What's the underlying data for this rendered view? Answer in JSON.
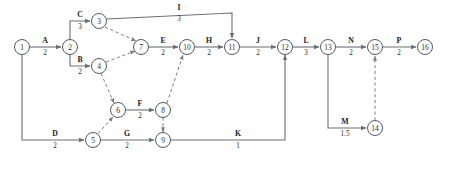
{
  "diagram": {
    "kind": "activity-on-arrow-network",
    "colors": {
      "background": "#ffffff",
      "node_stroke": "#555a5e",
      "edge_stroke": "#6a6f73",
      "dashed_stroke": "#7a7f83",
      "text": "#1d1d1d"
    },
    "nodes": [
      {
        "id": "1",
        "label": "1",
        "x": 22,
        "y": 47,
        "r": 7.5
      },
      {
        "id": "2",
        "label": "2",
        "x": 70,
        "y": 47,
        "r": 7.5
      },
      {
        "id": "3",
        "label": "3",
        "x": 99,
        "y": 21,
        "r": 7.5
      },
      {
        "id": "4",
        "label": "4",
        "x": 99,
        "y": 66,
        "r": 7.5
      },
      {
        "id": "5",
        "label": "5",
        "x": 93,
        "y": 140,
        "r": 7.5
      },
      {
        "id": "6",
        "label": "6",
        "x": 118,
        "y": 110,
        "r": 7.5
      },
      {
        "id": "7",
        "label": "7",
        "x": 141,
        "y": 47,
        "r": 7.5
      },
      {
        "id": "8",
        "label": "8",
        "x": 163,
        "y": 110,
        "r": 7.5
      },
      {
        "id": "9",
        "label": "9",
        "x": 163,
        "y": 140,
        "r": 7.5
      },
      {
        "id": "10",
        "label": "10",
        "x": 187,
        "y": 47,
        "r": 7.5
      },
      {
        "id": "11",
        "label": "11",
        "x": 232,
        "y": 47,
        "r": 7.5
      },
      {
        "id": "12",
        "label": "12",
        "x": 285,
        "y": 47,
        "r": 7.5
      },
      {
        "id": "13",
        "label": "13",
        "x": 328,
        "y": 47,
        "r": 7.5
      },
      {
        "id": "14",
        "label": "14",
        "x": 375,
        "y": 128,
        "r": 7.5
      },
      {
        "id": "15",
        "label": "15",
        "x": 375,
        "y": 47,
        "r": 7.5
      },
      {
        "id": "16",
        "label": "16",
        "x": 425,
        "y": 47,
        "r": 7.5
      }
    ],
    "activities": [
      {
        "name": "A",
        "duration": "2",
        "from": "1",
        "to": "2",
        "style": "solid",
        "path": "M 29.5 47 L 61 47",
        "label_x": 45,
        "label_name_y": 43,
        "label_dur_y": 50
      },
      {
        "name": "C",
        "duration": "3",
        "from": "2",
        "to": "3",
        "style": "solid",
        "path": "M 70 39.5 L 70 21 L 90 21",
        "label_x": 80,
        "label_name_y": 17,
        "label_dur_y": 24
      },
      {
        "name": "B",
        "duration": "2",
        "from": "2",
        "to": "4",
        "style": "solid",
        "path": "M 70 54.5 L 70 66 L 90 66",
        "label_x": 80,
        "label_name_y": 62,
        "label_dur_y": 69
      },
      {
        "name": "I",
        "duration": "3",
        "from": "3",
        "to": "11",
        "style": "solid",
        "path": "M 106.5 19 L 232 13 L 232 38",
        "label_x": 179,
        "label_name_y": 10,
        "label_dur_y": 16
      },
      {
        "name": "E",
        "duration": "2",
        "from": "7",
        "to": "10",
        "style": "solid",
        "path": "M 148.5 47 L 178 47",
        "label_x": 163,
        "label_name_y": 43,
        "label_dur_y": 50
      },
      {
        "name": "H",
        "duration": "2",
        "from": "10",
        "to": "11",
        "style": "solid",
        "path": "M 194.5 47 L 223 47",
        "label_x": 209,
        "label_name_y": 43,
        "label_dur_y": 50
      },
      {
        "name": "J",
        "duration": "2",
        "from": "11",
        "to": "12",
        "style": "solid",
        "path": "M 239.5 47 L 276 47",
        "label_x": 258,
        "label_name_y": 43,
        "label_dur_y": 50
      },
      {
        "name": "L",
        "duration": "3",
        "from": "12",
        "to": "13",
        "style": "solid",
        "path": "M 292.5 47 L 319 47",
        "label_x": 306,
        "label_name_y": 43,
        "label_dur_y": 50
      },
      {
        "name": "N",
        "duration": "2",
        "from": "13",
        "to": "15",
        "style": "solid",
        "path": "M 335.5 47 L 366 47",
        "label_x": 351,
        "label_name_y": 43,
        "label_dur_y": 50
      },
      {
        "name": "P",
        "duration": "2",
        "from": "15",
        "to": "16",
        "style": "solid",
        "path": "M 382.5 47 L 416 47",
        "label_x": 399,
        "label_name_y": 43,
        "label_dur_y": 50
      },
      {
        "name": "D",
        "duration": "2",
        "from": "1",
        "to": "5",
        "style": "solid",
        "path": "M 22 54.5 L 22 140 L 84 140",
        "label_x": 55,
        "label_name_y": 136,
        "label_dur_y": 143
      },
      {
        "name": "G",
        "duration": "2",
        "from": "5",
        "to": "9",
        "style": "solid",
        "path": "M 100.5 140 L 154 140",
        "label_x": 127,
        "label_name_y": 136,
        "label_dur_y": 143
      },
      {
        "name": "F",
        "duration": "2",
        "from": "6",
        "to": "8",
        "style": "solid",
        "path": "M 125.5 110 L 154 110",
        "label_x": 140,
        "label_name_y": 106,
        "label_dur_y": 113
      },
      {
        "name": "K",
        "duration": "1",
        "from": "9",
        "to": "12",
        "style": "solid",
        "path": "M 170.5 140 L 285 140 L 285 55",
        "label_x": 238,
        "label_name_y": 136,
        "label_dur_y": 143
      },
      {
        "name": "M",
        "duration": "1.5",
        "from": "13",
        "to": "14",
        "style": "solid",
        "path": "M 328 54.5 L 328 128 L 366 128",
        "label_x": 345,
        "label_name_y": 124,
        "label_dur_y": 131
      },
      {
        "name": "",
        "duration": "",
        "from": "3",
        "to": "7",
        "style": "dashed",
        "path": "M 105 27 L 136 41",
        "label_x": 0,
        "label_name_y": 0,
        "label_dur_y": 0
      },
      {
        "name": "",
        "duration": "",
        "from": "4",
        "to": "7",
        "style": "dashed",
        "path": "M 106 62 L 135 51",
        "label_x": 0,
        "label_name_y": 0,
        "label_dur_y": 0
      },
      {
        "name": "",
        "duration": "",
        "from": "4",
        "to": "6",
        "style": "dashed",
        "path": "M 101 73.5 L 114 103",
        "label_x": 0,
        "label_name_y": 0,
        "label_dur_y": 0
      },
      {
        "name": "",
        "duration": "",
        "from": "5",
        "to": "6",
        "style": "dashed",
        "path": "M 98 133.5 L 113 117",
        "label_x": 0,
        "label_name_y": 0,
        "label_dur_y": 0
      },
      {
        "name": "",
        "duration": "",
        "from": "8",
        "to": "9",
        "style": "dashed",
        "path": "M 163 117.5 L 163 132",
        "label_x": 0,
        "label_name_y": 0,
        "label_dur_y": 0
      },
      {
        "name": "",
        "duration": "",
        "from": "8",
        "to": "10",
        "style": "dashed",
        "path": "M 167 103 L 183 55",
        "label_x": 0,
        "label_name_y": 0,
        "label_dur_y": 0
      },
      {
        "name": "",
        "duration": "",
        "from": "14",
        "to": "15",
        "style": "dashed",
        "path": "M 375 120.5 L 375 56",
        "label_x": 0,
        "label_name_y": 0,
        "label_dur_y": 0
      }
    ]
  }
}
